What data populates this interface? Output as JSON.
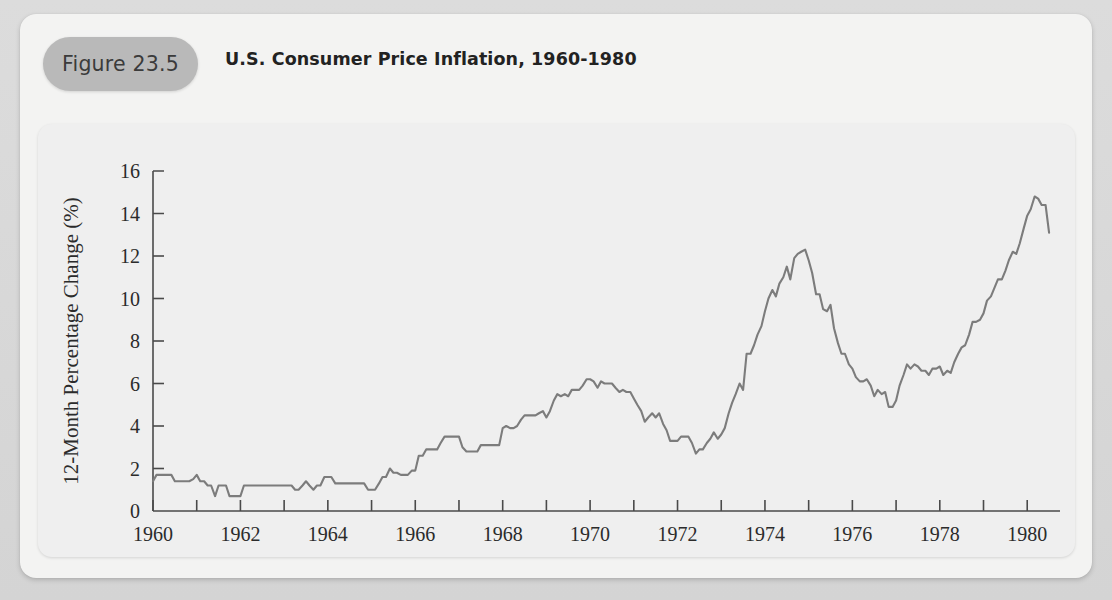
{
  "figure": {
    "badge_label": "Figure 23.5",
    "title": "U.S. Consumer Price Inflation, 1960-1980"
  },
  "colors": {
    "page_background": "#d8d8d8",
    "card_background": "#f3f3f2",
    "panel_background": "#efefef",
    "badge_background": "#b9b9b9",
    "line": "#7c7c7c",
    "axis": "#4a4a4a",
    "text": "#2b2b2b"
  },
  "chart_data": {
    "type": "line",
    "title": "U.S. Consumer Price Inflation, 1960-1980",
    "xlabel": "",
    "ylabel": "12-Month Percentage Change (%)",
    "xlim": [
      1960,
      1980.75
    ],
    "ylim": [
      0,
      16
    ],
    "grid": false,
    "legend": "none",
    "x_tick_labels": [
      "1960",
      "1962",
      "1964",
      "1966",
      "1968",
      "1970",
      "1972",
      "1974",
      "1976",
      "1978",
      "1980"
    ],
    "x_tick_values": [
      1960,
      1962,
      1964,
      1966,
      1968,
      1970,
      1972,
      1974,
      1976,
      1978,
      1980
    ],
    "x_minor_ticks": [
      1961,
      1963,
      1965,
      1967,
      1969,
      1971,
      1973,
      1975,
      1977,
      1979
    ],
    "y_tick_labels": [
      "0",
      "2",
      "4",
      "6",
      "8",
      "10",
      "12",
      "14",
      "16"
    ],
    "y_tick_values": [
      0,
      2,
      4,
      6,
      8,
      10,
      12,
      14,
      16
    ],
    "series": [
      {
        "name": "12-Month Percentage Change (%)",
        "color": "#7c7c7c",
        "x": [
          1960.0,
          1960.08,
          1960.17,
          1960.25,
          1960.33,
          1960.42,
          1960.5,
          1960.58,
          1960.67,
          1960.75,
          1960.83,
          1960.92,
          1961.0,
          1961.08,
          1961.17,
          1961.25,
          1961.33,
          1961.42,
          1961.5,
          1961.58,
          1961.67,
          1961.75,
          1961.83,
          1961.92,
          1962.0,
          1962.08,
          1962.17,
          1962.25,
          1962.33,
          1962.42,
          1962.5,
          1962.58,
          1962.67,
          1962.75,
          1962.83,
          1962.92,
          1963.0,
          1963.08,
          1963.17,
          1963.25,
          1963.33,
          1963.42,
          1963.5,
          1963.58,
          1963.67,
          1963.75,
          1963.83,
          1963.92,
          1964.0,
          1964.08,
          1964.17,
          1964.25,
          1964.33,
          1964.42,
          1964.5,
          1964.58,
          1964.67,
          1964.75,
          1964.83,
          1964.92,
          1965.0,
          1965.08,
          1965.17,
          1965.25,
          1965.33,
          1965.42,
          1965.5,
          1965.58,
          1965.67,
          1965.75,
          1965.83,
          1965.92,
          1966.0,
          1966.08,
          1966.17,
          1966.25,
          1966.33,
          1966.42,
          1966.5,
          1966.58,
          1966.67,
          1966.75,
          1966.83,
          1966.92,
          1967.0,
          1967.08,
          1967.17,
          1967.25,
          1967.33,
          1967.42,
          1967.5,
          1967.58,
          1967.67,
          1967.75,
          1967.83,
          1967.92,
          1968.0,
          1968.08,
          1968.17,
          1968.25,
          1968.33,
          1968.42,
          1968.5,
          1968.58,
          1968.67,
          1968.75,
          1968.83,
          1968.92,
          1969.0,
          1969.08,
          1969.17,
          1969.25,
          1969.33,
          1969.42,
          1969.5,
          1969.58,
          1969.67,
          1969.75,
          1969.83,
          1969.92,
          1970.0,
          1970.08,
          1970.17,
          1970.25,
          1970.33,
          1970.42,
          1970.5,
          1970.58,
          1970.67,
          1970.75,
          1970.83,
          1970.92,
          1971.0,
          1971.08,
          1971.17,
          1971.25,
          1971.33,
          1971.42,
          1971.5,
          1971.58,
          1971.67,
          1971.75,
          1971.83,
          1971.92,
          1972.0,
          1972.08,
          1972.17,
          1972.25,
          1972.33,
          1972.42,
          1972.5,
          1972.58,
          1972.67,
          1972.75,
          1972.83,
          1972.92,
          1973.0,
          1973.08,
          1973.17,
          1973.25,
          1973.33,
          1973.42,
          1973.5,
          1973.58,
          1973.67,
          1973.75,
          1973.83,
          1973.92,
          1974.0,
          1974.08,
          1974.17,
          1974.25,
          1974.33,
          1974.42,
          1974.5,
          1974.58,
          1974.67,
          1974.75,
          1974.83,
          1974.92,
          1975.0,
          1975.08,
          1975.17,
          1975.25,
          1975.33,
          1975.42,
          1975.5,
          1975.58,
          1975.67,
          1975.75,
          1975.83,
          1975.92,
          1976.0,
          1976.08,
          1976.17,
          1976.25,
          1976.33,
          1976.42,
          1976.5,
          1976.58,
          1976.67,
          1976.75,
          1976.83,
          1976.92,
          1977.0,
          1977.08,
          1977.17,
          1977.25,
          1977.33,
          1977.42,
          1977.5,
          1977.58,
          1977.67,
          1977.75,
          1977.83,
          1977.92,
          1978.0,
          1978.08,
          1978.17,
          1978.25,
          1978.33,
          1978.42,
          1978.5,
          1978.58,
          1978.67,
          1978.75,
          1978.83,
          1978.92,
          1979.0,
          1979.08,
          1979.17,
          1979.25,
          1979.33,
          1979.42,
          1979.5,
          1979.58,
          1979.67,
          1979.75,
          1979.83,
          1979.92,
          1980.0,
          1980.08,
          1980.17,
          1980.25,
          1980.33,
          1980.42,
          1980.5
        ],
        "y": [
          1.4,
          1.7,
          1.7,
          1.7,
          1.7,
          1.7,
          1.4,
          1.4,
          1.4,
          1.4,
          1.4,
          1.5,
          1.7,
          1.4,
          1.4,
          1.2,
          1.2,
          0.7,
          1.2,
          1.2,
          1.2,
          0.7,
          0.7,
          0.7,
          0.7,
          1.2,
          1.2,
          1.2,
          1.2,
          1.2,
          1.2,
          1.2,
          1.2,
          1.2,
          1.2,
          1.2,
          1.2,
          1.2,
          1.2,
          1.0,
          1.0,
          1.2,
          1.4,
          1.2,
          1.0,
          1.2,
          1.2,
          1.6,
          1.6,
          1.6,
          1.3,
          1.3,
          1.3,
          1.3,
          1.3,
          1.3,
          1.3,
          1.3,
          1.3,
          1.0,
          1.0,
          1.0,
          1.3,
          1.6,
          1.6,
          2.0,
          1.8,
          1.8,
          1.7,
          1.7,
          1.7,
          1.9,
          1.9,
          2.6,
          2.6,
          2.9,
          2.9,
          2.9,
          2.9,
          3.2,
          3.5,
          3.5,
          3.5,
          3.5,
          3.5,
          3.0,
          2.8,
          2.8,
          2.8,
          2.8,
          3.1,
          3.1,
          3.1,
          3.1,
          3.1,
          3.1,
          3.9,
          4.0,
          3.9,
          3.9,
          4.0,
          4.3,
          4.5,
          4.5,
          4.5,
          4.5,
          4.6,
          4.7,
          4.4,
          4.7,
          5.2,
          5.5,
          5.4,
          5.5,
          5.4,
          5.7,
          5.7,
          5.7,
          5.9,
          6.2,
          6.2,
          6.1,
          5.8,
          6.1,
          6.0,
          6.0,
          6.0,
          5.8,
          5.6,
          5.7,
          5.6,
          5.6,
          5.3,
          5.0,
          4.7,
          4.2,
          4.4,
          4.6,
          4.4,
          4.6,
          4.1,
          3.8,
          3.3,
          3.3,
          3.3,
          3.5,
          3.5,
          3.5,
          3.2,
          2.7,
          2.9,
          2.9,
          3.2,
          3.4,
          3.7,
          3.4,
          3.6,
          3.9,
          4.6,
          5.1,
          5.5,
          6.0,
          5.7,
          7.4,
          7.4,
          7.8,
          8.3,
          8.7,
          9.4,
          10.0,
          10.4,
          10.1,
          10.7,
          11.0,
          11.5,
          10.9,
          11.9,
          12.1,
          12.2,
          12.3,
          11.8,
          11.2,
          10.2,
          10.2,
          9.5,
          9.4,
          9.7,
          8.6,
          7.9,
          7.4,
          7.4,
          6.9,
          6.7,
          6.3,
          6.1,
          6.1,
          6.2,
          5.9,
          5.4,
          5.7,
          5.5,
          5.6,
          4.9,
          4.9,
          5.2,
          5.9,
          6.4,
          6.9,
          6.7,
          6.9,
          6.8,
          6.6,
          6.6,
          6.4,
          6.7,
          6.7,
          6.8,
          6.4,
          6.6,
          6.5,
          7.0,
          7.4,
          7.7,
          7.8,
          8.3,
          8.9,
          8.9,
          9.0,
          9.3,
          9.9,
          10.1,
          10.5,
          10.9,
          10.9,
          11.3,
          11.8,
          12.2,
          12.1,
          12.6,
          13.3,
          13.9,
          14.2,
          14.8,
          14.7,
          14.4,
          14.4,
          13.1
        ]
      }
    ],
    "annotations": [],
    "notes": {
      "peak_mid_1970s": 12.3,
      "peak_1980": 14.8,
      "trough_1961": 0.7,
      "trough_1972": 2.7
    }
  }
}
